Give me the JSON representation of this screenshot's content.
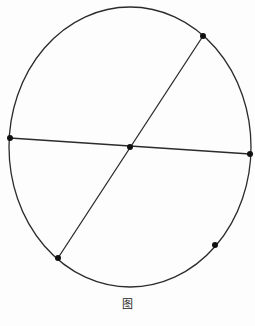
{
  "figure": {
    "caption": "图",
    "canvas": {
      "width": 255,
      "height": 326
    },
    "colors": {
      "background": "#fdfdfd",
      "line": "#2b2b2b",
      "dot": "#111111"
    },
    "circle": {
      "cx": 130,
      "cy": 147,
      "rx": 121,
      "ry": 140,
      "stroke_width": 1.3
    },
    "chords": [
      {
        "name": "diagonal-diameter",
        "x1": 203,
        "y1": 36,
        "x2": 58,
        "y2": 258
      },
      {
        "name": "horizontal-diameter",
        "x1": 10,
        "y1": 138,
        "x2": 250,
        "y2": 154
      }
    ],
    "points": [
      {
        "name": "top-right",
        "x": 203,
        "y": 36
      },
      {
        "name": "left",
        "x": 10,
        "y": 138
      },
      {
        "name": "center",
        "x": 130,
        "y": 147
      },
      {
        "name": "right",
        "x": 250,
        "y": 154
      },
      {
        "name": "bottom-left",
        "x": 58,
        "y": 258
      },
      {
        "name": "bottom-right",
        "x": 215,
        "y": 245
      }
    ],
    "point_radius": 3
  }
}
